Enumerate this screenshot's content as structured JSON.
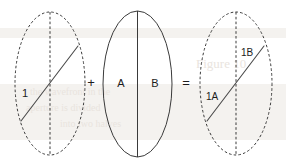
{
  "diagram": {
    "background_color": "#ffffff",
    "stroke_color": "#3a3a3a",
    "text_color": "#1c1c1c",
    "canvas": {
      "width": 286,
      "height": 166
    },
    "shapes": {
      "left_ellipse": {
        "name": "ellipse-1",
        "outline_style": "dashed",
        "center_axis_style": "dashed",
        "cx": 50,
        "cy": 83.5,
        "rx": 35,
        "ry": 71.5,
        "chord": {
          "x1": 21,
          "y1": 121,
          "x2": 78,
          "y2": 46
        },
        "labels": [
          {
            "text": "1",
            "x": 25,
            "y": 94
          }
        ]
      },
      "middle_ellipse": {
        "name": "ellipse-2",
        "outline_style": "solid",
        "center_axis_style": "solid",
        "cx": 137.5,
        "cy": 84,
        "rx": 34.5,
        "ry": 73,
        "labels": [
          {
            "text": "A",
            "x": 121,
            "y": 84
          },
          {
            "text": "B",
            "x": 155,
            "y": 84
          }
        ]
      },
      "right_ellipse": {
        "name": "ellipse-3",
        "outline_style": "dashed",
        "center_axis_style": "dashed",
        "cx": 236,
        "cy": 83.5,
        "rx": 36,
        "ry": 71.5,
        "chord": {
          "x1": 207,
          "y1": 121,
          "x2": 264,
          "y2": 46
        },
        "labels": [
          {
            "text": "1A",
            "x": 206,
            "y": 97
          },
          {
            "text": "1B",
            "x": 241,
            "y": 53
          }
        ]
      }
    },
    "operators": {
      "plus": {
        "symbol": "+",
        "x": 91,
        "y": 84
      },
      "equals": {
        "symbol": "=",
        "x": 186,
        "y": 84
      }
    },
    "watermark": {
      "visible": true,
      "color": "#e9e4de",
      "lines": [
        {
          "text": "Figure 10",
          "x": 196,
          "y": 64,
          "size": 13
        },
        {
          "text": "the wavefront in the",
          "x": 30,
          "y": 92,
          "size": 10
        },
        {
          "text": "aperture is divided",
          "x": 26,
          "y": 108,
          "size": 10
        },
        {
          "text": "into two halves",
          "x": 60,
          "y": 124,
          "size": 10
        }
      ]
    }
  }
}
